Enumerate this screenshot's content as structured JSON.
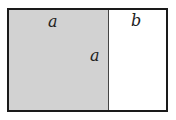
{
  "diagram": {
    "labels": {
      "square_top": "a",
      "square_side": "a",
      "rect_top": "b"
    },
    "colors": {
      "square_fill": "#d2d2d2",
      "rect_fill": "#ffffff",
      "border": "#1a1a1a"
    }
  }
}
